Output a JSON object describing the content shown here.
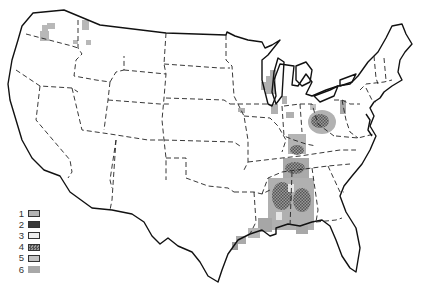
{
  "map": {
    "title": "",
    "region": "Contiguous United States",
    "boundaries": {
      "state_lines": "dashed",
      "coastline": "solid"
    }
  },
  "legend": {
    "items": [
      {
        "label": "1",
        "fill": "#b4b4b4",
        "border": "#333333",
        "pattern": "solid"
      },
      {
        "label": "2",
        "fill": "#3a3a3a",
        "border": "#222222",
        "pattern": "solid"
      },
      {
        "label": "3",
        "fill": "#eeeeee",
        "border": "#333333",
        "pattern": "solid"
      },
      {
        "label": "4",
        "fill": "#777777",
        "border": "#333333",
        "pattern": "checker"
      },
      {
        "label": "5",
        "fill": "#c4c4c4",
        "border": "#333333",
        "pattern": "solid"
      },
      {
        "label": "6",
        "fill": "#a8a8a8",
        "border": "none",
        "pattern": "solid"
      }
    ]
  },
  "colors": {
    "background": "#ffffff",
    "line": "#111111",
    "shade_light": "#c8c8c8",
    "shade_mid": "#a6a6a6",
    "shade_dark": "#777777"
  }
}
